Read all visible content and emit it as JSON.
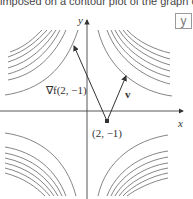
{
  "caption": "imposed on a contour plot of the graph of y.",
  "corner_box_label": "y",
  "axes": {
    "x_label": "x",
    "y_label": "y"
  },
  "point": {
    "label": "(2, −1)"
  },
  "vectors": {
    "gradient_label": "∇f(2, −1)",
    "v_label": "v"
  },
  "colors": {
    "line": "#444444",
    "contour": "#666666",
    "box_border": "#9a9a9a"
  }
}
